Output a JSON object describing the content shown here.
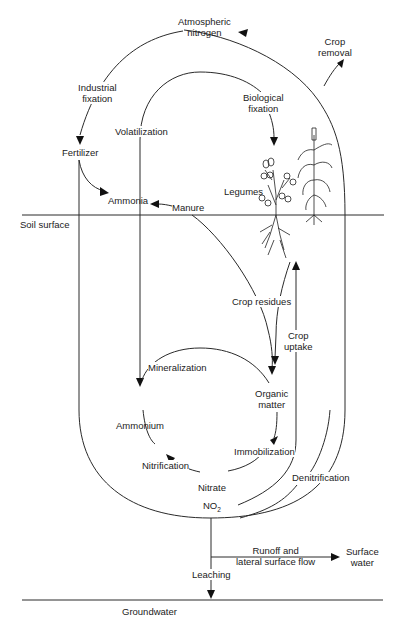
{
  "diagram": {
    "layers": {
      "soil_surface": "Soil surface",
      "groundwater": "Groundwater"
    },
    "nodes": {
      "atmospheric_nitrogen": "Atmospheric\nnitrogen",
      "fertilizer": "Fertilizer",
      "ammonia": "Ammonia",
      "manure": "Manure",
      "legumes": "Legumes",
      "organic_matter": "Organic\nmatter",
      "ammonium": "Ammonium",
      "nitrate": "Nitrate",
      "no2": "NO",
      "no2_sub": "2",
      "surface_water": "Surface\nwater"
    },
    "processes": {
      "industrial_fixation": "Industrial\nfixation",
      "volatilization": "Volatilization",
      "biological_fixation": "Biological\nfixation",
      "crop_removal": "Crop\nremoval",
      "crop_residues": "Crop residues",
      "crop_uptake": "Crop\nuptake",
      "mineralization": "Mineralization",
      "immobilization": "Immobilization",
      "nitrification": "Nitrification",
      "denitrification": "Denitrification",
      "runoff": "Runoff and\nlateral surface flow",
      "leaching": "Leaching"
    },
    "colors": {
      "line": "#2a2a2a",
      "text": "#222222",
      "background": "#ffffff"
    }
  }
}
